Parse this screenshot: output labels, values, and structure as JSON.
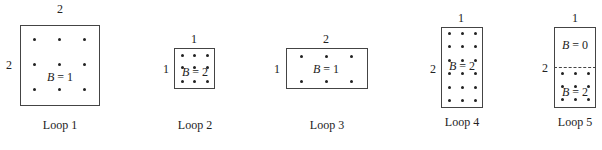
{
  "loops": [
    {
      "caption": "Loop 1",
      "width_label": "2",
      "height_label": "2",
      "field_label_var": "B",
      "field_label_eq": " = 1",
      "box": {
        "x": 20,
        "y": 25,
        "w": 80,
        "h": 81
      },
      "dots": {
        "cols": [
          35,
          59,
          84
        ],
        "rows": [
          39,
          64,
          89
        ]
      }
    },
    {
      "caption": "Loop 2",
      "width_label": "1",
      "height_label": "1",
      "field_label_var": "B",
      "field_label_eq": " = 2",
      "box": {
        "x": 174,
        "y": 48,
        "w": 41,
        "h": 41
      },
      "dots": {
        "cols": [
          181,
          194,
          207
        ],
        "rows": [
          55,
          68,
          81
        ]
      }
    },
    {
      "caption": "Loop 3",
      "width_label": "2",
      "height_label": "1",
      "field_label_var": "B",
      "field_label_eq": " = 1",
      "box": {
        "x": 286,
        "y": 48,
        "w": 82,
        "h": 41
      },
      "dots": {
        "cols": [
          300,
          325,
          351
        ],
        "rows": [
          55,
          81
        ]
      }
    },
    {
      "caption": "Loop 4",
      "width_label": "1",
      "height_label": "2",
      "field_label_var": "B",
      "field_label_eq": " = 2",
      "box": {
        "x": 441,
        "y": 27,
        "w": 42,
        "h": 81
      },
      "dots": {
        "cols": [
          449,
          462,
          475
        ],
        "rows": [
          33,
          46,
          59,
          73,
          86,
          99
        ]
      }
    },
    {
      "caption": "Loop 5",
      "width_label": "1",
      "height_label": "2",
      "upper_field_var": "B",
      "upper_field_eq": " = 0",
      "field_label_var": "B",
      "field_label_eq": " = 2",
      "box": {
        "x": 554,
        "y": 27,
        "w": 42,
        "h": 81
      },
      "dashed_y": 67,
      "dots": {
        "cols": [
          562,
          575,
          588
        ],
        "rows": [
          73,
          86,
          99
        ]
      }
    }
  ]
}
